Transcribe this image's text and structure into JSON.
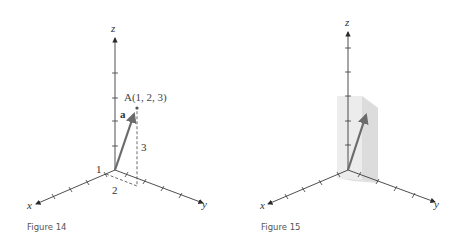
{
  "figures": [
    {
      "caption": "Figure 14",
      "axes": {
        "x": "x",
        "y": "y",
        "z": "z"
      },
      "point_label": "A(1, 2, 3)",
      "vector_label": "a",
      "component_labels": {
        "x": "1",
        "y": "2",
        "z": "3"
      },
      "vector_color": "#6b6b6b"
    },
    {
      "caption": "Figure 15",
      "axes": {
        "x": "x",
        "y": "y",
        "z": "z"
      },
      "box_color": "#e6e6e6",
      "vector_color": "#6b6b6b"
    }
  ]
}
